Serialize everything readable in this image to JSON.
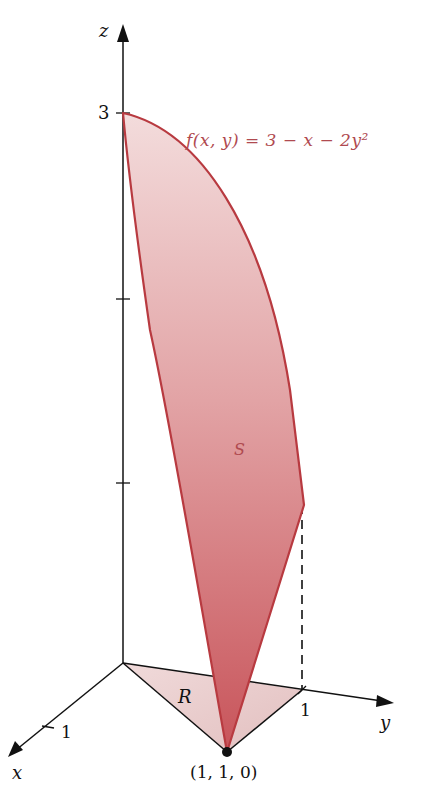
{
  "figure": {
    "function_label": "f(x, y) = 3 − x − 2y²",
    "surface_label": "S",
    "region_label": "R",
    "point_label": "(1, 1, 0)",
    "axes": {
      "z_label": "z",
      "y_label": "y",
      "x_label": "x",
      "z_tick_label": "3",
      "y_tick_label": "1",
      "x_tick_label": "1"
    },
    "colors": {
      "surface": "#c8545a",
      "surface_edge": "#b83a40",
      "region": "#e8c4c4",
      "label": "#b04a50",
      "axis": "#111111"
    }
  }
}
